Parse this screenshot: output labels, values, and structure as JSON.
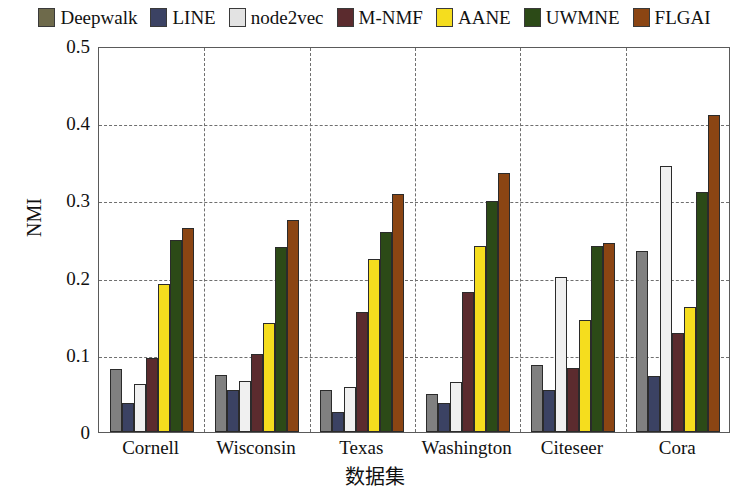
{
  "chart_data": {
    "type": "bar",
    "title": "",
    "xlabel": "数据集",
    "ylabel": "NMI",
    "categories": [
      "Cornell",
      "Wisconsin",
      "Texas",
      "Washington",
      "Citeseer",
      "Cora"
    ],
    "ylim": [
      0,
      0.5
    ],
    "ytick_labels": [
      "0",
      "0.1",
      "0.2",
      "0.3",
      "0.4",
      "0.5"
    ],
    "ytick_values": [
      0,
      0.1,
      0.2,
      0.3,
      0.4,
      0.5
    ],
    "grid": "horizontal and vertical dashed",
    "legend_position": "top-center-outside",
    "series": [
      {
        "name": "Deepwalk",
        "color": "#6E6A4B",
        "bar_color": "#808080",
        "values": [
          0.081,
          0.074,
          0.054,
          0.049,
          0.087,
          0.234
        ]
      },
      {
        "name": "LINE",
        "color": "#3B4263",
        "bar_color": "#3B4263",
        "values": [
          0.037,
          0.055,
          0.026,
          0.037,
          0.055,
          0.072
        ]
      },
      {
        "name": "node2vec",
        "color": "#E3E3E3",
        "bar_color": "#F0F0F0",
        "values": [
          0.062,
          0.066,
          0.058,
          0.065,
          0.201,
          0.344
        ]
      },
      {
        "name": "M-NMF",
        "color": "#5B2B2E",
        "bar_color": "#5B2B2E",
        "values": [
          0.096,
          0.101,
          0.156,
          0.181,
          0.083,
          0.128
        ]
      },
      {
        "name": "AANE",
        "color": "#F5DD1E",
        "bar_color": "#F5DD1E",
        "values": [
          0.192,
          0.141,
          0.224,
          0.241,
          0.145,
          0.162
        ]
      },
      {
        "name": "UWMNE",
        "color": "#2C4A17",
        "bar_color": "#2C4A17",
        "values": [
          0.249,
          0.24,
          0.259,
          0.299,
          0.241,
          0.311
        ]
      },
      {
        "name": "FLGAI",
        "color": "#8B4513",
        "bar_color": "#8B4513",
        "values": [
          0.264,
          0.275,
          0.308,
          0.335,
          0.245,
          0.41
        ]
      }
    ]
  }
}
